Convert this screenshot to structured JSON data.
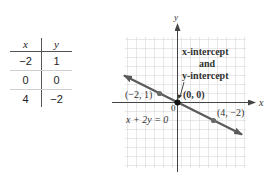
{
  "table": {
    "headers": [
      "x",
      "y"
    ],
    "rows": [
      [
        "−2",
        "1"
      ],
      [
        "0",
        "0"
      ],
      [
        "4",
        "−2"
      ]
    ]
  },
  "graph": {
    "axis_x_label": "x",
    "axis_y_label": "y",
    "origin_label": "0",
    "equation": "x + 2y = 0",
    "points": [
      {
        "label": "(−2, 1)",
        "x": -2,
        "y": 1
      },
      {
        "label": "(0, 0)",
        "x": 0,
        "y": 0
      },
      {
        "label": "(4, −2)",
        "x": 4,
        "y": -2
      }
    ],
    "annotation": {
      "line1": "x-intercept",
      "line2": "and",
      "line3": "y-intercept"
    },
    "colors": {
      "line": "#5a5a5a",
      "grid": "#d8d8d8",
      "axis": "#444444",
      "point": "#6a6a6a",
      "origin_point": "#111111"
    }
  }
}
